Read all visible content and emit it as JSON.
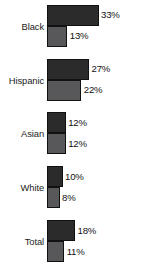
{
  "chart_data": {
    "type": "bar",
    "orientation": "horizontal",
    "title": "",
    "subtitle": "",
    "xlabel": "",
    "ylabel": "",
    "grid": false,
    "legend": "none",
    "axis_visible": false,
    "value_suffix": "%",
    "xlim": [
      0,
      35
    ],
    "categories": [
      "Black",
      "Hispanic",
      "Asian",
      "White",
      "Total"
    ],
    "series": [
      {
        "name": "series-1",
        "color": "#2b2b2b",
        "values": [
          33,
          27,
          12,
          10,
          18
        ],
        "labels": [
          "33%",
          "27%",
          "12%",
          "10%",
          "18%"
        ]
      },
      {
        "name": "series-2",
        "color": "#58585a",
        "values": [
          13,
          22,
          12,
          8,
          11
        ],
        "labels": [
          "13%",
          "22%",
          "12%",
          "8%",
          "11%"
        ]
      }
    ],
    "groups": [
      {
        "category": "Black",
        "bars": [
          {
            "label": "33%",
            "value": 33,
            "shade": "dark"
          },
          {
            "label": "13%",
            "value": 13,
            "shade": "light"
          }
        ]
      },
      {
        "category": "Hispanic",
        "bars": [
          {
            "label": "27%",
            "value": 27,
            "shade": "dark"
          },
          {
            "label": "22%",
            "value": 22,
            "shade": "light"
          }
        ]
      },
      {
        "category": "Asian",
        "bars": [
          {
            "label": "12%",
            "value": 12,
            "shade": "dark"
          },
          {
            "label": "12%",
            "value": 12,
            "shade": "light"
          }
        ]
      },
      {
        "category": "White",
        "bars": [
          {
            "label": "10%",
            "value": 10,
            "shade": "dark"
          },
          {
            "label": "8%",
            "value": 8,
            "shade": "light"
          }
        ]
      },
      {
        "category": "Total",
        "bars": [
          {
            "label": "18%",
            "value": 18,
            "shade": "dark"
          },
          {
            "label": "11%",
            "value": 11,
            "shade": "light"
          }
        ]
      }
    ]
  },
  "render": {
    "px_per_unit": 1.56,
    "bar_min_px": 3
  }
}
